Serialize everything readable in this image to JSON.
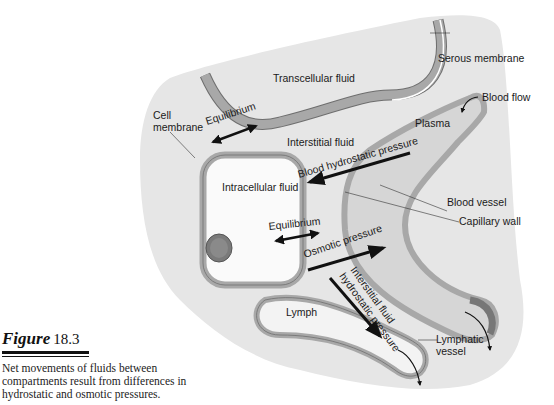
{
  "figure": {
    "label": "Figure",
    "number": "18.3",
    "caption": "Net movements of fluids between compartments result from differences in hydrostatic and osmotic pressures."
  },
  "labels": {
    "transcellular_fluid": "Transcellular fluid",
    "serous_membrane": "Serous membrane",
    "blood_flow": "Blood flow",
    "cell_membrane_line1": "Cell",
    "cell_membrane_line2": "membrane",
    "equilibrium_top": "Equilibrium",
    "interstitial_fluid": "Interstitial fluid",
    "plasma": "Plasma",
    "blood_hydrostatic_pressure": "Blood hydrostatic pressure",
    "intracellular_fluid": "Intracellular fluid",
    "blood_vessel": "Blood vessel",
    "capillary_wall": "Capillary wall",
    "equilibrium_cell": "Equilibrium",
    "osmotic_pressure": "Osmotic pressure",
    "interstitial_fluid_hp_line1": "Interstitial fluid",
    "interstitial_fluid_hp_line2": "hydrostatic pressure",
    "lymph": "Lymph",
    "lymphatic_vessel_line1": "Lymphatic",
    "lymphatic_vessel_line2": "vessel"
  },
  "colors": {
    "background_region": "#e6e6e6",
    "membrane": "#a8a8a8",
    "membrane_outline": "#6e6e6e",
    "plasma": "#d6d6d6",
    "cell_interior": "#fafafa",
    "nucleus": "#7a7a7a",
    "arrow": "#111111"
  }
}
